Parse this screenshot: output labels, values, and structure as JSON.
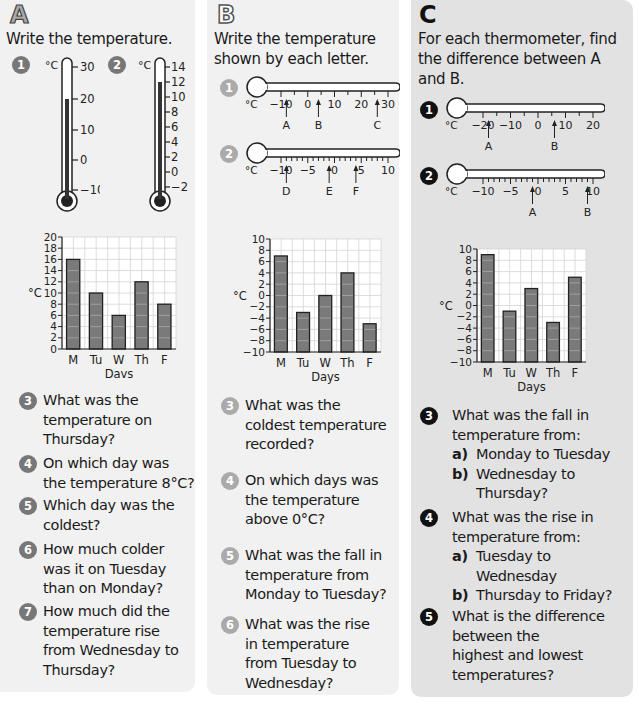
{
  "section_a": {
    "letter": "A",
    "instruction": "Write the temperature.",
    "thermometers": [
      {
        "number": "1",
        "unit": "°C",
        "ticks": [
          "30",
          "20",
          "10",
          "0",
          "−10"
        ],
        "reading": 19
      },
      {
        "number": "2",
        "unit": "°C",
        "ticks": [
          "14",
          "12",
          "10",
          "8",
          "6",
          "4",
          "2",
          "0",
          "−2"
        ],
        "reading": 12
      }
    ],
    "questions": [
      {
        "number": "3",
        "text": [
          "What was the",
          "temperature on",
          "Thursday?"
        ]
      },
      {
        "number": "4",
        "text": [
          "On which day was",
          "the temperature 8°C?"
        ]
      },
      {
        "number": "5",
        "text": [
          "Which day was the",
          "coldest?"
        ]
      },
      {
        "number": "6",
        "text": [
          "How much colder",
          "was it on Tuesday",
          "than on Monday?"
        ]
      },
      {
        "number": "7",
        "text": [
          "How much did the",
          "temperature rise",
          "from Wednesday to",
          "Thursday?"
        ]
      }
    ]
  },
  "section_b": {
    "letter": "B",
    "instruction": [
      "Write the temperature",
      "shown by each letter."
    ],
    "thermometers": [
      {
        "number": "1",
        "unit": "°C",
        "tick_labels": [
          "−10",
          "0",
          "10",
          "20",
          "30"
        ],
        "markers": [
          {
            "label": "A",
            "value": -8
          },
          {
            "label": "B",
            "value": 4
          },
          {
            "label": "C",
            "value": 26
          }
        ]
      },
      {
        "number": "2",
        "unit": "°C",
        "tick_labels": [
          "−10",
          "−5",
          "0",
          "5",
          "10"
        ],
        "markers": [
          {
            "label": "D",
            "value": -9
          },
          {
            "label": "E",
            "value": -1
          },
          {
            "label": "F",
            "value": 4
          }
        ]
      }
    ],
    "questions": [
      {
        "number": "3",
        "text": [
          "What was the",
          "coldest temperature",
          "recorded?"
        ]
      },
      {
        "number": "4",
        "text": [
          "On which days was",
          "the temperature",
          "above 0°C?"
        ]
      },
      {
        "number": "5",
        "text": [
          "What was the fall in",
          "temperature from",
          "Monday to Tuesday?"
        ]
      },
      {
        "number": "6",
        "text": [
          "What was the rise",
          "in temperature",
          "from Tuesday to",
          "Wednesday?"
        ]
      }
    ]
  },
  "section_c": {
    "letter": "C",
    "instruction": [
      "For each thermometer, find",
      "the difference between A",
      "and B."
    ],
    "thermometers": [
      {
        "number": "1",
        "unit": "°C",
        "tick_labels": [
          "−20",
          "−10",
          "0",
          "10",
          "20"
        ],
        "markers": [
          {
            "label": "A",
            "value": -18
          },
          {
            "label": "B",
            "value": 6
          }
        ]
      },
      {
        "number": "2",
        "unit": "°C",
        "tick_labels": [
          "−10",
          "−5",
          "0",
          "5",
          "10"
        ],
        "markers": [
          {
            "label": "A",
            "value": -1
          },
          {
            "label": "B",
            "value": 9
          }
        ]
      }
    ],
    "questions": [
      {
        "number": "3",
        "text": [
          "What was the fall in",
          "temperature from:"
        ],
        "parts": [
          {
            "label": "a)",
            "text": [
              "Monday to Tuesday"
            ]
          },
          {
            "label": "b)",
            "text": [
              "Wednesday to",
              "Thursday?"
            ]
          }
        ]
      },
      {
        "number": "4",
        "text": [
          "What was the rise in",
          "temperature from:"
        ],
        "parts": [
          {
            "label": "a)",
            "text": [
              "Tuesday to",
              "Wednesday"
            ]
          },
          {
            "label": "b)",
            "text": [
              "Thursday to Friday?"
            ]
          }
        ]
      },
      {
        "number": "5",
        "text": [
          "What is the difference",
          "between the",
          "highest and lowest",
          "temperatures?"
        ]
      }
    ]
  },
  "chart_data": [
    {
      "type": "bar",
      "title": "",
      "categories": [
        "M",
        "Tu",
        "W",
        "Th",
        "F"
      ],
      "values": [
        16,
        10,
        6,
        12,
        8
      ],
      "xlabel": "Days",
      "ylabel": "°C",
      "ylim": [
        0,
        20
      ],
      "yticks": [
        0,
        2,
        4,
        6,
        8,
        10,
        12,
        14,
        16,
        18,
        20
      ],
      "grid": true
    },
    {
      "type": "bar",
      "title": "",
      "categories": [
        "M",
        "Tu",
        "W",
        "Th",
        "F"
      ],
      "values": [
        7,
        -3,
        0,
        4,
        -5
      ],
      "xlabel": "Days",
      "ylabel": "°C",
      "ylim": [
        -10,
        10
      ],
      "yticks": [
        -10,
        -8,
        -6,
        -4,
        -2,
        0,
        2,
        4,
        6,
        8,
        10
      ],
      "grid": true
    },
    {
      "type": "bar",
      "title": "",
      "categories": [
        "M",
        "Tu",
        "W",
        "Th",
        "F"
      ],
      "values": [
        9,
        -1,
        3,
        -3,
        5
      ],
      "xlabel": "Days",
      "ylabel": "°C",
      "ylim": [
        -10,
        10
      ],
      "yticks": [
        -10,
        -8,
        -6,
        -4,
        -2,
        0,
        2,
        4,
        6,
        8,
        10
      ],
      "grid": true
    }
  ],
  "colors": {
    "panel_light": "#f1f1f1",
    "panel_dark": "#e2e2e2",
    "bar_fill": "#7a7a7a",
    "badge_a": "#777777",
    "badge_b": "#aaaaaa",
    "badge_c": "#111111"
  }
}
